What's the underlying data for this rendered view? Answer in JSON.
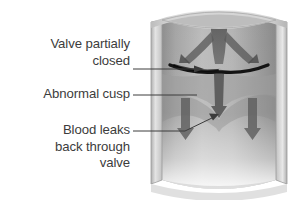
{
  "figure": {
    "type": "medical-illustration",
    "background_color": "#ffffff",
    "text_color": "#3c3c3c",
    "labels": [
      {
        "id": "valve-partially-closed",
        "text": "Valve partially\nclosed",
        "leader": "arrow"
      },
      {
        "id": "abnormal-cusp",
        "text": "Abnormal cusp",
        "leader": "plain"
      },
      {
        "id": "blood-leaks-back",
        "text": "Blood leaks\nback through\nvalve",
        "leader": "arrow"
      }
    ],
    "illustration": {
      "vessel_wall_color": "#c9c9c9",
      "vessel_interior_color": "#a8a8a8",
      "blood_flow_color": "#555555",
      "valve_line_color": "#1a1a1a",
      "leader_line_color": "#3c3c3c"
    }
  }
}
